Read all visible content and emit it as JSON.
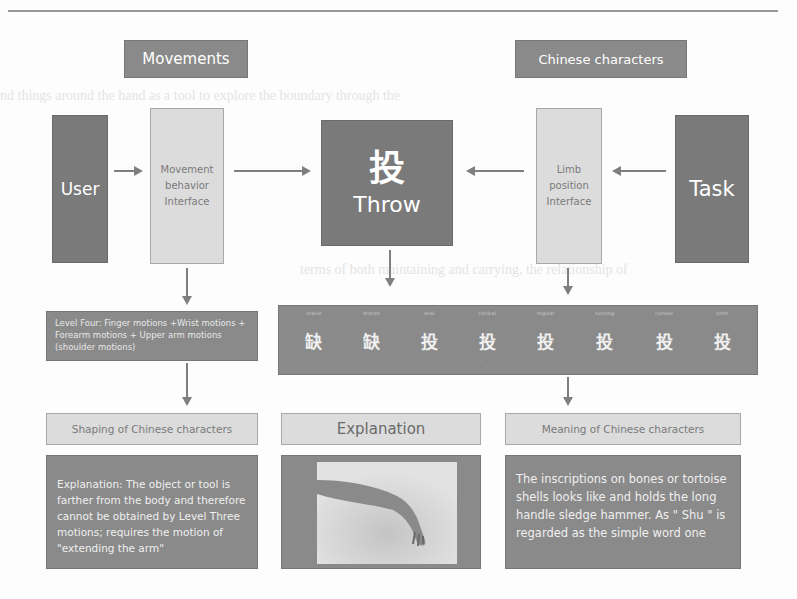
{
  "top_labels": {
    "movements": "Movements",
    "chinese_characters": "Chinese characters"
  },
  "ghost_text": [
    "nd things around the hand as a tool to explore the boundary through the",
    "terms of both maintaining and carrying, the relationship of",
    "knowledge of character"
  ],
  "flow": {
    "user": "User",
    "movement_interface": [
      "Movement",
      "behavior",
      "Interface"
    ],
    "center": {
      "glyph": "投",
      "label": "Throw"
    },
    "limb_interface": [
      "Limb",
      "position",
      "Interface"
    ],
    "task": "Task"
  },
  "level_box": {
    "text": "Level Four: Finger motions +Wrist motions + Forearm motions + Upper arm motions (shoulder motions)"
  },
  "glyph_strip": {
    "glyphs": [
      "缺",
      "缺",
      "投",
      "投",
      "投",
      "投",
      "投",
      "投"
    ],
    "styles": [
      "oracle",
      "bronze",
      "seal",
      "clerical",
      "regular",
      "running",
      "cursive",
      "print"
    ]
  },
  "bottom": {
    "shaping": {
      "title": "Shaping of Chinese characters",
      "text": "Explanation: The object or tool is farther from the body and therefore cannot be obtained by Level Three motions; requires the motion of \"extending the arm\""
    },
    "explanation": {
      "title": "Explanation",
      "image_alt": "arm extended reaching down"
    },
    "meaning": {
      "title": "Meaning of Chinese characters",
      "text": "The inscriptions on bones or tortoise shells looks like and holds the long handle sledge hammer. As \" Shu \" is regarded as the simple word one"
    }
  },
  "colors": {
    "dark_box": "#7a7a7a",
    "light_box": "#dcdcdc",
    "arrow": "#7f7f7f"
  }
}
